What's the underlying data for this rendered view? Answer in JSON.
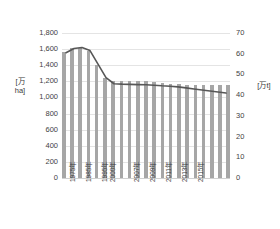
{
  "chart_data": {
    "type": "bar",
    "title": "",
    "subtitle": "",
    "xlabel": "",
    "ylabel": "[万ha]",
    "y2label": "[万t]",
    "ylim": [
      0,
      1800
    ],
    "y2lim": [
      0,
      70
    ],
    "grid": true,
    "legend": "none",
    "x": [
      "1975年",
      "1980年",
      "1985年",
      "1990年",
      "1995年",
      "2000年",
      "2005年",
      "2006年",
      "2007年",
      "2008年",
      "2009年",
      "2010年",
      "2011年",
      "2012年",
      "2013年",
      "2014年",
      "2015年",
      "2016年",
      "2017年",
      "2018年",
      "2019年"
    ],
    "categories": [
      "1975年",
      "1980年",
      "1985年",
      "1990年",
      "1995年",
      "2000年",
      "2005年",
      "2006年",
      "2007年",
      "2008年",
      "2009年",
      "2010年",
      "2011年",
      "2012年",
      "2013年",
      "2014年",
      "2015年",
      "2016年",
      "2017年",
      "2018年",
      "2019年"
    ],
    "y_ticks": [
      "1,800",
      "1,600",
      "1,400",
      "1,200",
      "1,000",
      "800",
      "600",
      "400",
      "200",
      "0"
    ],
    "y_tick_values": [
      1800,
      1600,
      1400,
      1200,
      1000,
      800,
      600,
      400,
      200,
      0
    ],
    "y2_ticks": [
      "70",
      "60",
      "50",
      "40",
      "30",
      "20",
      "10",
      "0"
    ],
    "y2_tick_values": [
      70,
      60,
      50,
      40,
      30,
      20,
      10,
      0
    ],
    "x_tick_labels_shown": [
      "1975年",
      "1985年",
      "1995年",
      "2000年",
      "2007年",
      "2009年",
      "2011年",
      "2013年",
      "2015年"
    ],
    "series": [
      {
        "name": "耕地面積",
        "type": "bar",
        "axis": "left",
        "unit": "万ha",
        "color": "#a6a6a6",
        "values": [
          1560,
          1610,
          1620,
          1580,
          1400,
          1240,
          1200,
          1200,
          1200,
          1200,
          1200,
          1190,
          1180,
          1170,
          1170,
          1160,
          1160,
          1150,
          1150,
          1150,
          1150
        ]
      },
      {
        "name": "生産量",
        "type": "line",
        "axis": "right",
        "unit": "万t",
        "color": "#575757",
        "values": [
          60.5,
          62.5,
          63.0,
          61.5,
          55.0,
          48.5,
          45.5,
          45.3,
          45.2,
          45.1,
          45.0,
          44.8,
          44.5,
          44.3,
          44.0,
          43.5,
          43.0,
          42.5,
          42.0,
          41.5,
          41.0
        ]
      }
    ]
  },
  "axis_titles": {
    "left": "[万ha]",
    "right": "[万t]"
  }
}
